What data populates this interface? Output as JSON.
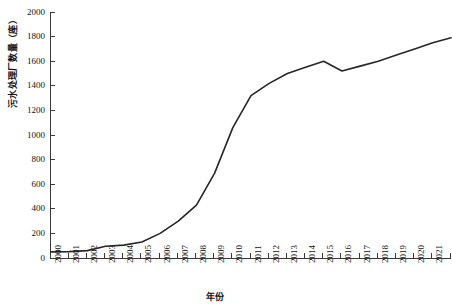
{
  "chart_data": {
    "type": "line",
    "title": "",
    "xlabel": "年份",
    "ylabel": "污水处理厂数量（座）",
    "x": [
      2000,
      2001,
      2002,
      2003,
      2004,
      2005,
      2006,
      2007,
      2008,
      2009,
      2010,
      2011,
      2012,
      2013,
      2014,
      2015,
      2016,
      2017,
      2018,
      2019,
      2020,
      2021,
      2022
    ],
    "xticklabels": [
      "2000",
      "2001",
      "2002",
      "2003",
      "2004",
      "2005",
      "2006",
      "2007",
      "2008",
      "2009",
      "2010",
      "2011",
      "2012",
      "2013",
      "2014",
      "2015",
      "2016",
      "2017",
      "2018",
      "2019",
      "2020",
      "2021",
      "2022"
    ],
    "values": [
      50,
      52,
      60,
      95,
      105,
      130,
      200,
      300,
      430,
      690,
      1060,
      1320,
      1420,
      1500,
      1550,
      1600,
      1520,
      1560,
      1600,
      1650,
      1700,
      1750,
      1790
    ],
    "yticks": [
      0,
      200,
      400,
      600,
      800,
      1000,
      1200,
      1400,
      1600,
      1800,
      2000
    ],
    "yticklabels": [
      "0",
      "200",
      "400",
      "600",
      "800",
      "1000",
      "1200",
      "1400",
      "1600",
      "1800",
      "2000"
    ],
    "ylim": [
      0,
      2000
    ],
    "xlim": [
      2000,
      2022
    ],
    "grid": false,
    "legend": null,
    "line_color": "#262626",
    "line_width": 1.6,
    "markers": false,
    "axis_color": "#3a3a3a",
    "background_color": "#ffffff"
  }
}
